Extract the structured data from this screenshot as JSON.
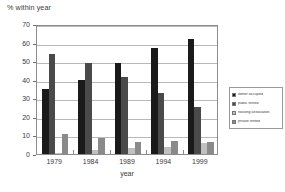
{
  "chart_data": {
    "type": "bar",
    "title": "% within year",
    "xlabel": "year",
    "ylabel": "",
    "ylim": [
      0,
      70
    ],
    "ytick_step": 10,
    "yticks": [
      0,
      10,
      20,
      30,
      40,
      50,
      60,
      70
    ],
    "grid": true,
    "legend_position": "right",
    "categories": [
      "1979",
      "1984",
      "1989",
      "1994",
      "1999"
    ],
    "series": [
      {
        "name": "owner occupied",
        "color": "#1a1a1a",
        "values": [
          35,
          40,
          49,
          57,
          62
        ]
      },
      {
        "name": "public rented",
        "color": "#4a4a4a",
        "values": [
          54,
          49,
          41.5,
          33,
          25.5
        ]
      },
      {
        "name": "housing association",
        "color": "#c0c0c0",
        "values": [
          0.7,
          2,
          3.3,
          4,
          5.8
        ]
      },
      {
        "name": "private rented",
        "color": "#8a8a8a",
        "values": [
          10.7,
          8.5,
          6.5,
          7,
          6.7
        ]
      }
    ]
  },
  "legend": {
    "items": [
      {
        "label": "owner occupied",
        "color": "#1a1a1a"
      },
      {
        "label": "public rented",
        "color": "#4a4a4a"
      },
      {
        "label": "housing association",
        "color": "#c0c0c0"
      },
      {
        "label": "private rented",
        "color": "#8a8a8a"
      }
    ]
  },
  "colors": {
    "axis": "#8c8c8c",
    "grid": "#b9b9b9",
    "text": "#3a3a3a",
    "background": "#ffffff"
  }
}
